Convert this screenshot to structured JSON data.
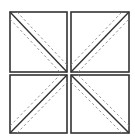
{
  "diagram": {
    "colors": {
      "stroke": "#333333",
      "dashed": "#888888",
      "background": "#ffffff"
    },
    "squares": [
      {
        "id": "top-left",
        "x": 10,
        "y": 12,
        "w": 57,
        "h": 60,
        "diagonal": "tl-br"
      },
      {
        "id": "top-right",
        "x": 71,
        "y": 12,
        "w": 58,
        "h": 60,
        "diagonal": "bl-tr"
      },
      {
        "id": "bottom-left",
        "x": 10,
        "y": 75,
        "w": 57,
        "h": 58,
        "diagonal": "bl-tr"
      },
      {
        "id": "bottom-right",
        "x": 71,
        "y": 75,
        "w": 58,
        "h": 58,
        "diagonal": "tl-br"
      }
    ]
  }
}
